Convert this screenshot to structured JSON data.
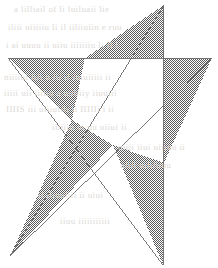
{
  "figure": {
    "canvas": {
      "width": 218,
      "height": 268,
      "background": "#ffffff"
    },
    "style": {
      "stroke_color": "#6b6b6b",
      "stroke_width": 0.9,
      "fill_pattern": "dotted-halftone",
      "pattern_dot_color": "#5a5a5a",
      "pattern_background": "#ffffff",
      "pattern_cell_px": 2
    },
    "vertices": {
      "outer": [
        {
          "name": "top",
          "x": 164,
          "y": 5,
          "filled": true
        },
        {
          "name": "right",
          "x": 212,
          "y": 58,
          "filled": true
        },
        {
          "name": "bottom-right",
          "x": 163,
          "y": 265,
          "filled": true
        },
        {
          "name": "bottom-left",
          "x": 10,
          "y": 256,
          "filled": true
        },
        {
          "name": "left",
          "x": 8,
          "y": 58,
          "filled": true
        }
      ],
      "inner": [
        {
          "name": "inner-top-left",
          "x": 85,
          "y": 58
        },
        {
          "name": "inner-top-right",
          "x": 164,
          "y": 58
        },
        {
          "name": "inner-right",
          "x": 164,
          "y": 163
        },
        {
          "name": "inner-bottom",
          "x": 113,
          "y": 145
        },
        {
          "name": "inner-left",
          "x": 72,
          "y": 120
        }
      ]
    },
    "segments": [
      {
        "name": "segment-top-to-bottom-left",
        "from": "top",
        "to": "bottom-left"
      },
      {
        "name": "segment-bottom-left-to-right",
        "from": "bottom-left",
        "to": "right"
      },
      {
        "name": "segment-right-to-left",
        "from": "right",
        "to": "left"
      },
      {
        "name": "segment-left-to-bottom-right",
        "from": "left",
        "to": "bottom-right"
      },
      {
        "name": "segment-bottom-right-to-top",
        "from": "bottom-right",
        "to": "top"
      }
    ],
    "filled_regions": [
      {
        "name": "point-top",
        "polygon": "164,5 164,58 85,58"
      },
      {
        "name": "point-right",
        "polygon": "212,58 164,163 164,58"
      },
      {
        "name": "point-left",
        "polygon": "8,58 85,58 72,120"
      },
      {
        "name": "point-bottom-left",
        "polygon": "10,256 72,120 113,145"
      },
      {
        "name": "point-bottom-right",
        "polygon": "163,265 113,145 164,163"
      }
    ],
    "unfilled_regions": [
      {
        "name": "central-pentagon",
        "polygon": "85,58 164,58 164,163 113,145 72,120"
      }
    ],
    "counts": {
      "points": 5,
      "line_segments": 5,
      "filled_triangles": 5
    }
  },
  "background_artifacts": {
    "note": "faint show-through text from reverse of scanned page",
    "lines": [
      {
        "text": "a  lilliail  of  li  luiluaii  lie",
        "x": 14,
        "y": 10
      },
      {
        "text": "iliii  uiiiiiu  li  il    iiliiuiin  e  ruu",
        "x": 8,
        "y": 28
      },
      {
        "text": "i  ai  uuuu  ii  uiiu  iiiiiiiu  li  il  i",
        "x": 6,
        "y": 46
      },
      {
        "text": "niiiiui  iiii  u  iii  ii  iuiuiiiii  ii",
        "x": 4,
        "y": 78
      },
      {
        "text": "iiiii  uii  iiiiiu  a  uuliiiy  iiuuiii",
        "x": 4,
        "y": 94
      },
      {
        "text": "IIIIS  iii  uiiiuiiii  ii  IIIIIi  i    ii",
        "x": 6,
        "y": 110
      },
      {
        "text": "iiiiiiu  ui  uu  uiiui  ii",
        "x": 52,
        "y": 128
      },
      {
        "text": "uiiii  iiui  uiiiuu  ii",
        "x": 118,
        "y": 148
      },
      {
        "text": "uiiii  uiiiiiiuu",
        "x": 120,
        "y": 166
      },
      {
        "text": "ii  iiiuuiiii  ii  uiui",
        "x": 38,
        "y": 196
      },
      {
        "text": "iiuu  iiiiiiiiiii",
        "x": 60,
        "y": 222
      }
    ]
  }
}
